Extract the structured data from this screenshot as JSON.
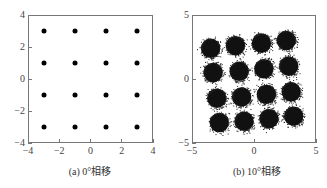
{
  "chart_data": [
    {
      "type": "scatter",
      "title": "",
      "caption": "(a) 0°相移",
      "xlabel": "",
      "ylabel": "",
      "xlim": [
        -4,
        4
      ],
      "ylim": [
        -4,
        4
      ],
      "xticks": [
        -4,
        -2,
        0,
        2,
        4
      ],
      "yticks": [
        -4,
        -2,
        0,
        2,
        4
      ],
      "xtick_labels": [
        "−4",
        "−2",
        "0",
        "2",
        "4"
      ],
      "ytick_labels": [
        "−4",
        "−2",
        "0",
        "2",
        "4"
      ],
      "grid": false,
      "legend": null,
      "description": "16-QAM constellation, ideal points (no phase offset)",
      "points": [
        [
          -3,
          3
        ],
        [
          -1,
          3
        ],
        [
          1,
          3
        ],
        [
          3,
          3
        ],
        [
          -3,
          1
        ],
        [
          -1,
          1
        ],
        [
          1,
          1
        ],
        [
          3,
          1
        ],
        [
          -3,
          -1
        ],
        [
          -1,
          -1
        ],
        [
          1,
          -1
        ],
        [
          3,
          -1
        ],
        [
          -3,
          -3
        ],
        [
          -1,
          -3
        ],
        [
          1,
          -3
        ],
        [
          3,
          -3
        ]
      ]
    },
    {
      "type": "scatter",
      "title": "",
      "caption": "(b) 10°相移",
      "xlabel": "",
      "ylabel": "",
      "xlim": [
        -5,
        5
      ],
      "ylim": [
        -5,
        5
      ],
      "xticks": [
        -5,
        0,
        5
      ],
      "yticks": [
        -5,
        0,
        5
      ],
      "xtick_labels": [
        "−5",
        "0",
        "5"
      ],
      "ytick_labels": [
        "−5",
        "0",
        "5"
      ],
      "grid": false,
      "legend": null,
      "description": "16-QAM constellation with noise and 10° phase rotation; clusters rotated counter-clockwise",
      "cluster_centers": [
        [
          -3.5,
          2.4
        ],
        [
          -1.5,
          2.6
        ],
        [
          0.6,
          2.8
        ],
        [
          2.6,
          3.0
        ],
        [
          -3.3,
          0.5
        ],
        [
          -1.2,
          0.6
        ],
        [
          0.8,
          0.8
        ],
        [
          2.8,
          1.0
        ],
        [
          -3.0,
          -1.5
        ],
        [
          -1.0,
          -1.4
        ],
        [
          1.0,
          -1.2
        ],
        [
          3.0,
          -1.0
        ],
        [
          -2.8,
          -3.4
        ],
        [
          -0.8,
          -3.3
        ],
        [
          1.2,
          -3.1
        ],
        [
          3.2,
          -2.9
        ]
      ],
      "cluster_radius": 0.8
    }
  ]
}
